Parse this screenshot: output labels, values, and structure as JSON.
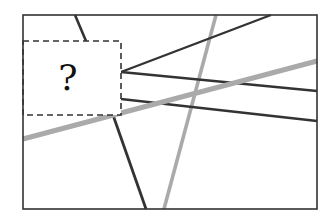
{
  "diagram": {
    "type": "line-puzzle",
    "frame": {
      "x": 23,
      "y": 15,
      "width": 294,
      "height": 194,
      "stroke": "#333333"
    },
    "hidden_region": {
      "x": 23,
      "y": 41,
      "width": 98,
      "height": 74,
      "label": "?",
      "stroke": "#333333",
      "dash": "6,4"
    },
    "colors": {
      "dark": "#333333",
      "gray": "#aaaaaa",
      "background": "#ffffff"
    },
    "lines": [
      {
        "id": "dark-a",
        "x1": 75,
        "y1": 15,
        "x2": 86,
        "y2": 41,
        "color": "dark",
        "width": 2.6
      },
      {
        "id": "dark-b",
        "x1": 113,
        "y1": 115,
        "x2": 146,
        "y2": 209,
        "color": "dark",
        "width": 2.8
      },
      {
        "id": "dark-c",
        "x1": 121,
        "y1": 72,
        "x2": 271,
        "y2": 15,
        "color": "dark",
        "width": 2.4
      },
      {
        "id": "dark-d",
        "x1": 121,
        "y1": 72,
        "x2": 317,
        "y2": 91,
        "color": "dark",
        "width": 2.4
      },
      {
        "id": "dark-e",
        "x1": 121,
        "y1": 99,
        "x2": 317,
        "y2": 121,
        "color": "dark",
        "width": 2.4
      },
      {
        "id": "gray-steep",
        "x1": 216,
        "y1": 15,
        "x2": 164,
        "y2": 209,
        "color": "gray",
        "width": 3.6
      },
      {
        "id": "gray-thick",
        "x1": 23,
        "y1": 139,
        "x2": 317,
        "y2": 61,
        "color": "gray",
        "width": 5
      }
    ]
  }
}
